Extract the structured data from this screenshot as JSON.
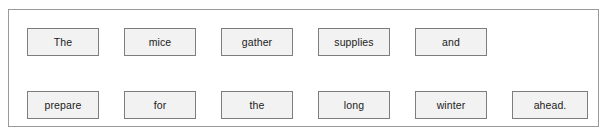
{
  "panel": {
    "name": "sentence-word-tiles",
    "background_color": "#ffffff",
    "border_color": "#9a9a9a"
  },
  "tile_style": {
    "fill_color": "#f2f2f2",
    "border_color": "#7d7d7d",
    "text_color": "#1b1b1b"
  },
  "sentence": "The mice gather supplies and prepare for the long winter ahead.",
  "rows": [
    {
      "row_index": 1,
      "tiles": [
        {
          "label": "The"
        },
        {
          "label": "mice"
        },
        {
          "label": "gather"
        },
        {
          "label": "supplies"
        },
        {
          "label": "and"
        },
        {
          "label": ""
        }
      ]
    },
    {
      "row_index": 2,
      "tiles": [
        {
          "label": "prepare"
        },
        {
          "label": "for"
        },
        {
          "label": "the"
        },
        {
          "label": "long"
        },
        {
          "label": "winter"
        },
        {
          "label": "ahead."
        }
      ]
    }
  ]
}
